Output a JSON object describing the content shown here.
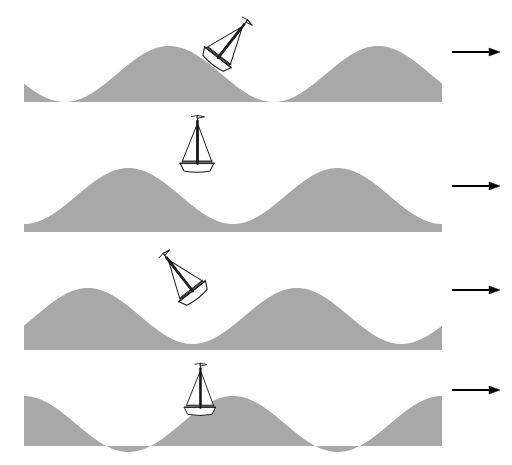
{
  "figure": {
    "background_color": "#ffffff",
    "water_color": "#a8a8a8",
    "line_color": "#000000",
    "canvas": {
      "width": 512,
      "height": 465
    }
  },
  "geometry": {
    "water_left_x": 24,
    "water_right_x": 442,
    "wavelength": 209,
    "amplitude": 28
  },
  "arrow": {
    "icon": "arrow-right-icon",
    "label": "wave travel direction",
    "x_start": 452,
    "x_end": 500,
    "head_length": 11,
    "head_half_width": 4,
    "shaft_width": 1.8,
    "color": "#000000"
  },
  "boat": {
    "icon": "sailboat-icon",
    "label": "sailboat",
    "hull_length": 34,
    "hull_depth": 8,
    "mast_height": 40,
    "pennant": "flag",
    "sails": 2,
    "stroke_color": "#1a1a1a"
  },
  "panels": [
    {
      "index": 1,
      "name": "panel-wave-phase-1",
      "label": "Phase 1 — boat on the forward (leading) face of the crest, heeled bow-down to the right",
      "top": 6,
      "height": 96,
      "baseline_y": 74,
      "phase_deg": 200,
      "boat": {
        "x": 218,
        "y": 57,
        "tilt_deg": 38,
        "scale": 1.0,
        "position_label": "leading face of crest",
        "attitude": "tilted clockwise"
      },
      "arrow_y": 52
    },
    {
      "index": 2,
      "name": "panel-wave-phase-2",
      "label": "Phase 2 — boat level on top of the crest",
      "top": 118,
      "height": 114,
      "baseline_y": 196,
      "phase_deg": 270,
      "boat": {
        "x": 197,
        "y": 163,
        "tilt_deg": 0,
        "scale": 1.0,
        "position_label": "crest",
        "attitude": "upright"
      },
      "arrow_y": 186
    },
    {
      "index": 3,
      "name": "panel-wave-phase-3",
      "label": "Phase 3 — boat on the back (trailing) face of the crest, heeled bow-up to the left",
      "top": 258,
      "height": 92,
      "baseline_y": 316,
      "phase_deg": 340,
      "boat": {
        "x": 192,
        "y": 291,
        "tilt_deg": -38,
        "scale": 1.0,
        "position_label": "trailing face of crest",
        "attitude": "tilted counter-clockwise"
      },
      "arrow_y": 290
    },
    {
      "index": 4,
      "name": "panel-wave-phase-4",
      "label": "Phase 4 — boat level in the trough between crests",
      "top": 368,
      "height": 78,
      "baseline_y": 424,
      "phase_deg": 90,
      "boat": {
        "x": 200,
        "y": 407,
        "tilt_deg": 0,
        "scale": 0.92,
        "position_label": "trough",
        "attitude": "upright"
      },
      "arrow_y": 390
    }
  ]
}
